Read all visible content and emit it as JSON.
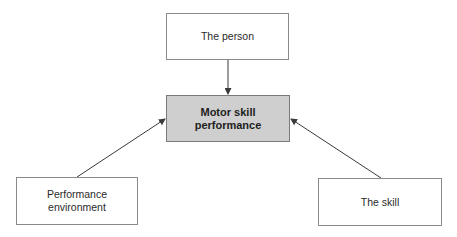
{
  "diagram": {
    "nodes": {
      "person": {
        "label": "The person"
      },
      "center": {
        "label": "Motor skill\nperformance"
      },
      "environment": {
        "label": "Performance\nenvironment"
      },
      "skill": {
        "label": "The skill"
      }
    },
    "edges": [
      {
        "from": "The person",
        "to": "Motor skill performance"
      },
      {
        "from": "Performance environment",
        "to": "Motor skill performance"
      },
      {
        "from": "The skill",
        "to": "Motor skill performance"
      }
    ],
    "colors": {
      "center_fill": "#cfcfcf",
      "border": "#8a8a8a",
      "arrow": "#3a3a3a"
    }
  }
}
